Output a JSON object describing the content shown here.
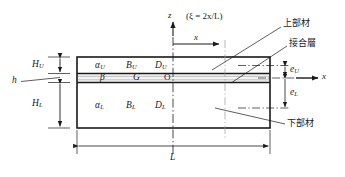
{
  "figure": {
    "colors": {
      "line": "#1a1a1a",
      "thin_line": "#555555",
      "background": "#ffffff",
      "bond_layer_fill": "#f2f2f2"
    }
  },
  "axes": {
    "z_label": "z",
    "x_label_top": "x",
    "x_label_right": "x",
    "xi_note": "(ξ = 2x/L)",
    "origin_label": "O"
  },
  "upper_member": {
    "alpha": "α",
    "alpha_sub": "U",
    "B": "B",
    "B_sub": "U",
    "D": "D",
    "D_sub": "U"
  },
  "bond_layer": {
    "beta": "β",
    "G": "G"
  },
  "lower_member": {
    "alpha": "α",
    "alpha_sub": "L",
    "B": "B",
    "B_sub": "L",
    "D": "D",
    "D_sub": "L"
  },
  "dimensions": {
    "H_upper": "H",
    "H_upper_sub": "U",
    "H_lower": "H",
    "H_lower_sub": "L",
    "h": "h",
    "e_upper": "e",
    "e_upper_sub": "U",
    "e_lower": "e",
    "e_lower_sub": "L",
    "length": "L"
  },
  "callouts": {
    "upper_member": "上部材",
    "bond_layer": "接合層",
    "lower_member": "下部材"
  }
}
